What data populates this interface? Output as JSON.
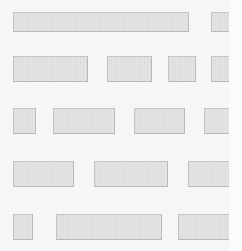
{
  "canvas": {
    "width": 242,
    "height": 251,
    "clip_right": 229
  },
  "colors": {
    "background": "#f6f6f6",
    "block_fill": "#e2e2e2",
    "block_border": "#b9b9b9"
  },
  "rows": [
    {
      "top": 12,
      "height": 20,
      "blocks": [
        {
          "left": 13,
          "width": 176
        },
        {
          "left": 211,
          "width": 30
        }
      ]
    },
    {
      "top": 56,
      "height": 26,
      "blocks": [
        {
          "left": 13,
          "width": 75
        },
        {
          "left": 107,
          "width": 45
        },
        {
          "left": 168,
          "width": 28
        },
        {
          "left": 211,
          "width": 30
        }
      ]
    },
    {
      "top": 108,
      "height": 26,
      "blocks": [
        {
          "left": 13,
          "width": 23
        },
        {
          "left": 53,
          "width": 62
        },
        {
          "left": 134,
          "width": 51
        },
        {
          "left": 204,
          "width": 37
        }
      ]
    },
    {
      "top": 161,
      "height": 26,
      "blocks": [
        {
          "left": 13,
          "width": 61
        },
        {
          "left": 94,
          "width": 74
        },
        {
          "left": 188,
          "width": 53
        }
      ]
    },
    {
      "top": 214,
      "height": 26,
      "blocks": [
        {
          "left": 13,
          "width": 20
        },
        {
          "left": 56,
          "width": 106
        },
        {
          "left": 178,
          "width": 63
        }
      ]
    }
  ]
}
